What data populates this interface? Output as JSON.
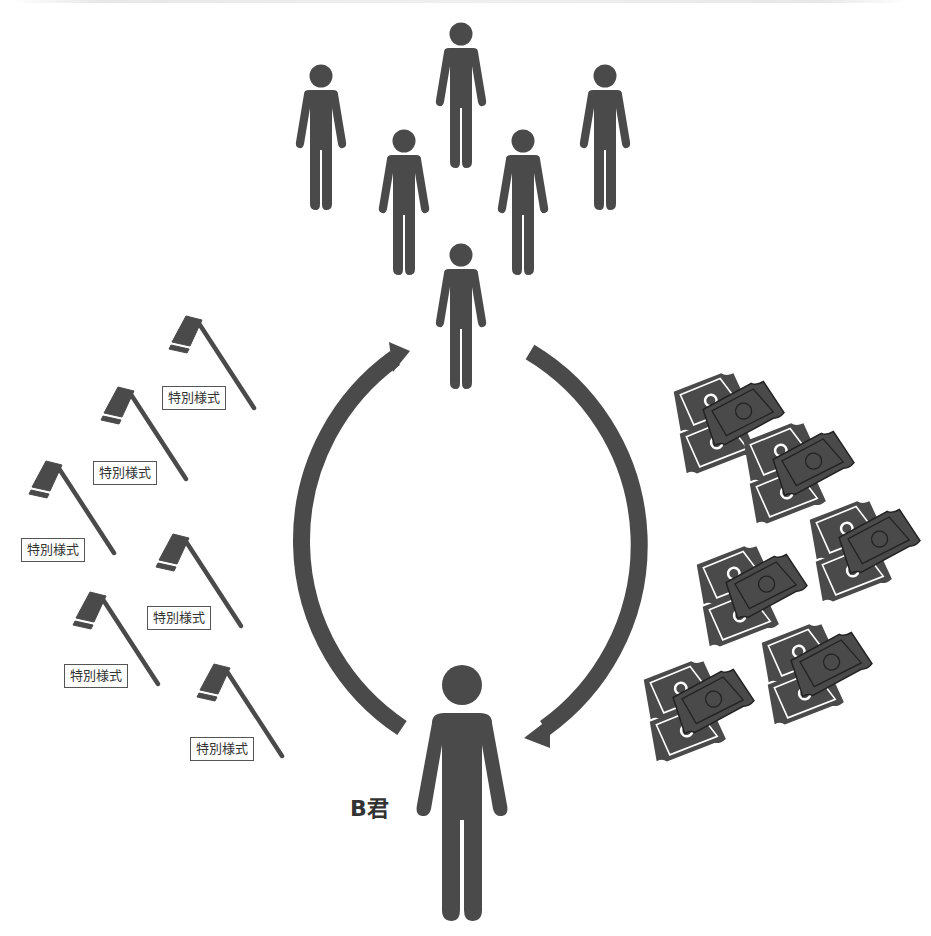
{
  "diagram": {
    "colors": {
      "figure": "#4a4a4a",
      "background": "#ffffff",
      "label_border": "#555555",
      "bill_line": "#ffffff"
    },
    "people_group": {
      "count": 6,
      "icon": "person-icon"
    },
    "main_person": {
      "label": "B君",
      "icon": "person-icon"
    },
    "cycle_arrows": [
      {
        "name": "left-arrow",
        "direction": "up",
        "from": "B君",
        "to": "people-group"
      },
      {
        "name": "right-arrow",
        "direction": "down",
        "from": "people-group",
        "to": "B君"
      }
    ],
    "hoes": {
      "icon": "hoe-icon",
      "label": "特別様式",
      "items": [
        {
          "label": "特別様式"
        },
        {
          "label": "特別様式"
        },
        {
          "label": "特別様式"
        },
        {
          "label": "特別様式"
        },
        {
          "label": "特別様式"
        },
        {
          "label": "特別様式"
        }
      ]
    },
    "money": {
      "icon": "banknote-stack-icon",
      "count": 6
    }
  }
}
